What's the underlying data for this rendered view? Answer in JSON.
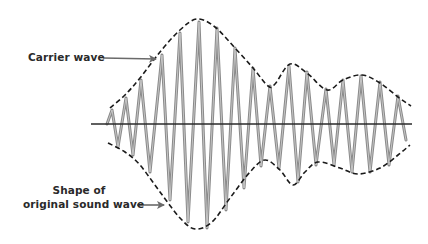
{
  "labels": {
    "carrier_wave": "Carrier wave",
    "shape_line1": "Shape of",
    "shape_line2": "original sound wave"
  },
  "colors": {
    "background": "#ffffff",
    "carrier_wave": "#8a8a8a",
    "envelope": "#1a1a1a",
    "baseline": "#2a2a2a",
    "arrow": "#6a6a6a",
    "text": "#2a2a2a"
  },
  "diagram": {
    "baseline": {
      "x1": 91,
      "x2": 412,
      "y": 124
    },
    "upper_envelope": [
      [
        110,
        108
      ],
      [
        125,
        95
      ],
      [
        140,
        78
      ],
      [
        160,
        52
      ],
      [
        180,
        30
      ],
      [
        197,
        19
      ],
      [
        215,
        27
      ],
      [
        235,
        48
      ],
      [
        253,
        68
      ],
      [
        268,
        86
      ],
      [
        275,
        84
      ],
      [
        290,
        64
      ],
      [
        307,
        73
      ],
      [
        327,
        90
      ],
      [
        343,
        80
      ],
      [
        362,
        75
      ],
      [
        380,
        83
      ],
      [
        398,
        97
      ],
      [
        411,
        106
      ]
    ],
    "lower_envelope": [
      [
        108,
        143
      ],
      [
        125,
        152
      ],
      [
        140,
        165
      ],
      [
        160,
        192
      ],
      [
        180,
        218
      ],
      [
        195,
        229
      ],
      [
        212,
        222
      ],
      [
        230,
        198
      ],
      [
        250,
        172
      ],
      [
        265,
        160
      ],
      [
        280,
        170
      ],
      [
        293,
        185
      ],
      [
        305,
        172
      ],
      [
        318,
        162
      ],
      [
        340,
        168
      ],
      [
        358,
        174
      ],
      [
        380,
        168
      ],
      [
        398,
        155
      ],
      [
        410,
        145
      ]
    ],
    "carrier_points": [
      [
        107,
        124
      ],
      [
        112,
        110
      ],
      [
        118,
        147
      ],
      [
        126,
        98
      ],
      [
        133,
        155
      ],
      [
        141,
        80
      ],
      [
        150,
        172
      ],
      [
        162,
        55
      ],
      [
        170,
        200
      ],
      [
        180,
        33
      ],
      [
        188,
        222
      ],
      [
        199,
        22
      ],
      [
        207,
        228
      ],
      [
        217,
        28
      ],
      [
        226,
        210
      ],
      [
        235,
        48
      ],
      [
        244,
        188
      ],
      [
        253,
        68
      ],
      [
        261,
        166
      ],
      [
        270,
        86
      ],
      [
        279,
        168
      ],
      [
        289,
        66
      ],
      [
        298,
        182
      ],
      [
        307,
        72
      ],
      [
        316,
        165
      ],
      [
        326,
        89
      ],
      [
        334,
        165
      ],
      [
        343,
        80
      ],
      [
        352,
        172
      ],
      [
        361,
        76
      ],
      [
        370,
        172
      ],
      [
        380,
        82
      ],
      [
        389,
        165
      ],
      [
        398,
        96
      ],
      [
        406,
        140
      ]
    ],
    "arrows": {
      "carrier": {
        "x1": 103,
        "y1": 58,
        "x2": 156,
        "y2": 59
      },
      "shape": {
        "x1": 137,
        "y1": 205,
        "x2": 164,
        "y2": 205
      }
    }
  }
}
